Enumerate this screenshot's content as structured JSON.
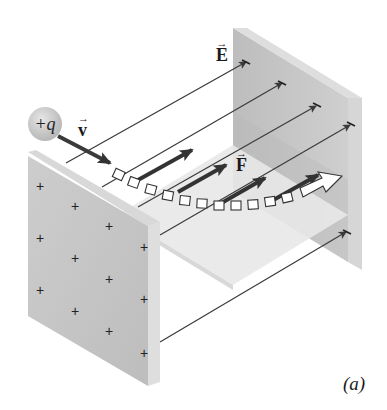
{
  "figure": {
    "caption": "(a)"
  },
  "labels": {
    "charge": "+q",
    "velocity": "v",
    "field": "E",
    "force": "F",
    "arrow_mark": "→"
  },
  "plates": {
    "left": {
      "charge_sign": "+",
      "plus_count": 12,
      "color": "#c6c6c6"
    },
    "right": {
      "charge_sign": "−",
      "color": "#c9c9c9"
    }
  },
  "field_lines": {
    "count": 5
  },
  "force_arrows": {
    "count": 4
  },
  "trajectory": {
    "segments": 12,
    "shape": "parabolic curve"
  },
  "colors": {
    "plate_face": "#c4c4c4",
    "plate_edge": "#dcdcdc",
    "line": "#3a3a3a",
    "force_arrow": "#333333",
    "velocity_arrow": "#3a3a3a",
    "floor": "#e6e6e6"
  }
}
